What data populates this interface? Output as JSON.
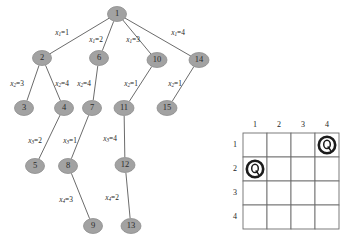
{
  "figure": {
    "node_fill_color": "#a2a2a2",
    "edge_color": "#5a5a5a",
    "marker_color": "#1c1c1c"
  },
  "tree": {
    "nodes": [
      {
        "id": "1",
        "label": "1",
        "x": 117,
        "y": 14,
        "rx": 9.5,
        "ry": 7.5
      },
      {
        "id": "2",
        "label": "2",
        "x": 42,
        "y": 58,
        "rx": 9.5,
        "ry": 7.5
      },
      {
        "id": "6",
        "label": "6",
        "x": 99,
        "y": 58,
        "rx": 9.5,
        "ry": 7.5
      },
      {
        "id": "10",
        "label": "10",
        "x": 157,
        "y": 60,
        "rx": 10,
        "ry": 7.5
      },
      {
        "id": "14",
        "label": "14",
        "x": 199,
        "y": 60,
        "rx": 10,
        "ry": 7.5
      },
      {
        "id": "3",
        "label": "3",
        "x": 24,
        "y": 108,
        "rx": 9.5,
        "ry": 7.5
      },
      {
        "id": "4",
        "label": "4",
        "x": 64,
        "y": 108,
        "rx": 9.5,
        "ry": 7.5
      },
      {
        "id": "7",
        "label": "7",
        "x": 92,
        "y": 108,
        "rx": 9.5,
        "ry": 7.5
      },
      {
        "id": "11",
        "label": "11",
        "x": 124,
        "y": 108,
        "rx": 10,
        "ry": 7.5
      },
      {
        "id": "15",
        "label": "15",
        "x": 167,
        "y": 108,
        "rx": 10,
        "ry": 7.5
      },
      {
        "id": "5",
        "label": "5",
        "x": 35,
        "y": 166,
        "rx": 9.5,
        "ry": 7.5
      },
      {
        "id": "8",
        "label": "8",
        "x": 68,
        "y": 166,
        "rx": 9.5,
        "ry": 7.5
      },
      {
        "id": "12",
        "label": "12",
        "x": 125,
        "y": 165,
        "rx": 10,
        "ry": 7.5
      },
      {
        "id": "9",
        "label": "9",
        "x": 93,
        "y": 226,
        "rx": 9.5,
        "ry": 7.5
      },
      {
        "id": "13",
        "label": "13",
        "x": 131,
        "y": 226,
        "rx": 10,
        "ry": 7.5
      }
    ],
    "edges": [
      {
        "from": "1",
        "to": "2",
        "var": "x",
        "sub": "1",
        "value": "1",
        "lx": 62,
        "ly": 33
      },
      {
        "from": "1",
        "to": "6",
        "var": "x",
        "sub": "1",
        "value": "2",
        "lx": 96,
        "ly": 40
      },
      {
        "from": "1",
        "to": "10",
        "var": "x",
        "sub": "1",
        "value": "3",
        "lx": 133,
        "ly": 40
      },
      {
        "from": "1",
        "to": "14",
        "var": "x",
        "sub": "1",
        "value": "4",
        "lx": 178,
        "ly": 33
      },
      {
        "from": "2",
        "to": "3",
        "var": "x",
        "sub": "2",
        "value": "3",
        "lx": 17,
        "ly": 84
      },
      {
        "from": "2",
        "to": "4",
        "var": "x",
        "sub": "2",
        "value": "4",
        "lx": 62,
        "ly": 84
      },
      {
        "from": "6",
        "to": "7",
        "var": "x",
        "sub": "2",
        "value": "4",
        "lx": 84,
        "ly": 84
      },
      {
        "from": "10",
        "to": "11",
        "var": "x",
        "sub": "2",
        "value": "1",
        "lx": 131,
        "ly": 84
      },
      {
        "from": "14",
        "to": "15",
        "var": "x",
        "sub": "2",
        "value": "1",
        "lx": 175,
        "ly": 84
      },
      {
        "from": "4",
        "to": "5",
        "var": "x",
        "sub": "3",
        "value": "2",
        "lx": 35,
        "ly": 141
      },
      {
        "from": "7",
        "to": "8",
        "var": "x",
        "sub": "3",
        "value": "1",
        "lx": 70,
        "ly": 141
      },
      {
        "from": "11",
        "to": "12",
        "var": "x",
        "sub": "3",
        "value": "4",
        "lx": 110,
        "ly": 139
      },
      {
        "from": "8",
        "to": "9",
        "var": "x",
        "sub": "4",
        "value": "3",
        "lx": 66,
        "ly": 200
      },
      {
        "from": "12",
        "to": "13",
        "var": "x",
        "sub": "4",
        "value": "2",
        "lx": 112,
        "ly": 198
      }
    ]
  },
  "board": {
    "column_headers": [
      "1",
      "2",
      "3",
      "4"
    ],
    "row_headers": [
      "1",
      "2",
      "3",
      "4"
    ],
    "queens": [
      {
        "row": 1,
        "col": 4,
        "glyph": "Q"
      },
      {
        "row": 2,
        "col": 1,
        "glyph": "Q"
      }
    ],
    "origin_x": 15,
    "origin_y": 133,
    "cell_size": 24
  }
}
